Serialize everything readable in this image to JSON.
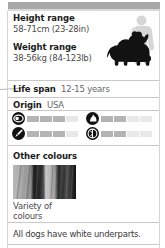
{
  "card": {
    "stats": [
      {
        "label": "Height range",
        "value": "58-71cm (23-28in)"
      },
      {
        "label": "Weight range",
        "value": "38-56kg (84-123lb)"
      }
    ],
    "inline_stats": [
      {
        "label": "Life span",
        "value": "12-15 years"
      },
      {
        "label": "Origin",
        "value": "USA"
      }
    ],
    "ratings": [
      {
        "icon": "muzzle-icon",
        "filled": 3,
        "total": 5
      },
      {
        "icon": "dog-sit-icon",
        "filled": 2,
        "total": 5
      },
      {
        "icon": "brush-icon",
        "filled": 3,
        "total": 5
      },
      {
        "icon": "exercise-icon",
        "filled": 2,
        "total": 5
      }
    ],
    "other_colours": {
      "title": "Other colours",
      "swatch_name": "fur-texture-swatch",
      "caption": "Variety of\ncolours"
    },
    "footnote": "All dogs have white underparts.",
    "silhouettes": {
      "dog_name": "dog-silhouette",
      "human_name": "human-scale-silhouette",
      "dog_color": "#121212",
      "human_color": "#d6d6d6"
    },
    "colors": {
      "header_bar": "#a8a8a8",
      "rule": "#c9c9c9",
      "bar_filled": "#b4b4b4",
      "bar_empty": "#e8e8e8",
      "icon": "#111111"
    }
  }
}
